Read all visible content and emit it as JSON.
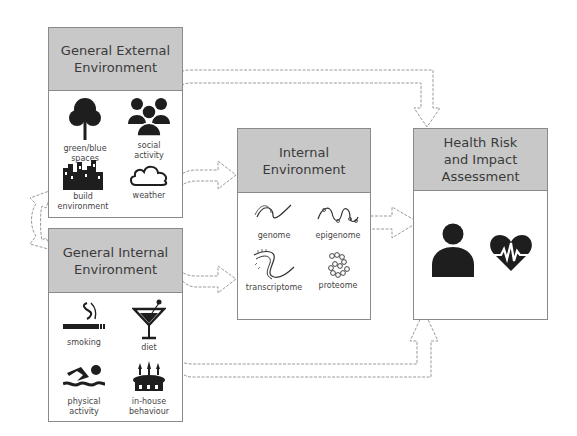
{
  "boxes": {
    "external": {
      "title": "General External\nEnvironment",
      "items": [
        {
          "label": "green/blue\nspaces",
          "icon": "tree-icon"
        },
        {
          "label": "social\nactivity",
          "icon": "people-group-icon"
        },
        {
          "label": "build\nenvironment",
          "icon": "city-buildings-icon"
        },
        {
          "label": "weather",
          "icon": "cloud-icon"
        }
      ]
    },
    "internal_general": {
      "title": "General Internal\nEnvironment",
      "items": [
        {
          "label": "smoking",
          "icon": "cigarette-icon"
        },
        {
          "label": "diet",
          "icon": "cocktail-glass-icon"
        },
        {
          "label": "physical\nactivity",
          "icon": "swimmer-icon"
        },
        {
          "label": "in-house\nbehaviour",
          "icon": "cake-icon"
        }
      ]
    },
    "internal": {
      "title": "Internal\nEnvironment",
      "items": [
        {
          "label": "genome",
          "icon": "dna-strand-icon"
        },
        {
          "label": "epigenome",
          "icon": "methylated-strand-icon"
        },
        {
          "label": "transcriptome",
          "icon": "rna-strand-icon"
        },
        {
          "label": "proteome",
          "icon": "protein-chain-icon"
        }
      ]
    },
    "health": {
      "title": "Health Risk\nand Impact\nAssessment",
      "items": [
        {
          "label": "",
          "icon": "person-icon"
        },
        {
          "label": "",
          "icon": "heart-pulse-icon"
        }
      ]
    }
  },
  "colors": {
    "header_fill": "#c8c8c8",
    "border": "#8a8a8a",
    "icon_fill": "#1e1e1e",
    "arrow_stroke": "#9a9a9a"
  }
}
